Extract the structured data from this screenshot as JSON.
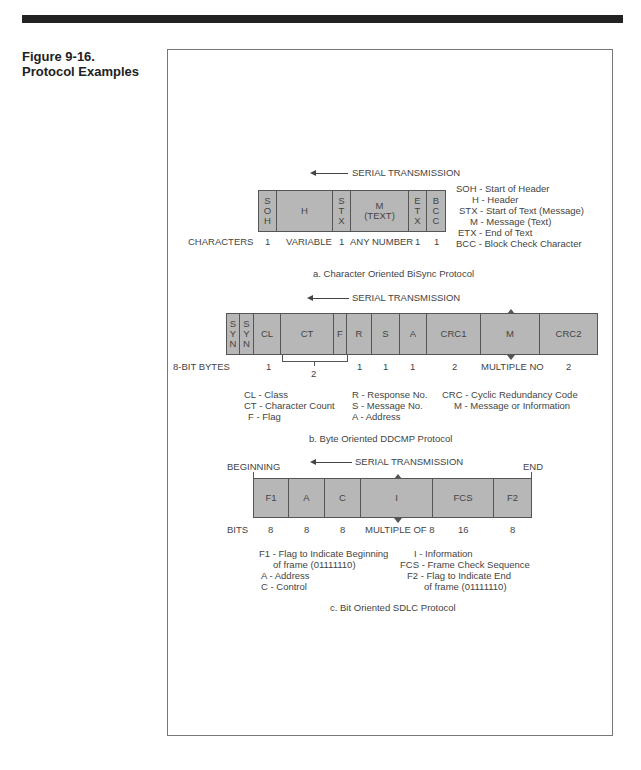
{
  "figure": {
    "number": "Figure 9-16.",
    "title": "Protocol Examples"
  },
  "serial_label": "SERIAL TRANSMISSION",
  "diagram_a": {
    "caption": "a. Character Oriented BiSync Protocol",
    "row_label": "CHARACTERS",
    "fields": [
      {
        "label": "S\nO\nH",
        "size": "1"
      },
      {
        "label": "H",
        "size": "VARIABLE"
      },
      {
        "label": "S\nT\nX",
        "size": "1"
      },
      {
        "label": "M\n(TEXT)",
        "size": "ANY NUMBER"
      },
      {
        "label": "E\nT\nX",
        "size": "1"
      },
      {
        "label": "B\nC\nC",
        "size": "1"
      }
    ],
    "legend": [
      "SOH - Start of Header",
      "H - Header",
      "STX - Start of Text (Message)",
      "M - Message (Text)",
      "ETX - End of Text",
      "BCC - Block Check Character"
    ]
  },
  "diagram_b": {
    "caption": "b. Byte Oriented DDCMP Protocol",
    "row_label": "8-BIT BYTES",
    "fields": [
      {
        "label": "S\nY\nN",
        "size": ""
      },
      {
        "label": "S\nY\nN",
        "size": ""
      },
      {
        "label": "CL",
        "size": "1"
      },
      {
        "label": "CT",
        "size": ""
      },
      {
        "label": "F",
        "size": ""
      },
      {
        "label": "R",
        "size": "1"
      },
      {
        "label": "S",
        "size": "1"
      },
      {
        "label": "A",
        "size": "1"
      },
      {
        "label": "CRC1",
        "size": "2"
      },
      {
        "label": "M",
        "size": "MULTIPLE NO"
      },
      {
        "label": "CRC2",
        "size": "2"
      }
    ],
    "ct_f_size": "2",
    "legend_col1": [
      "CL - Class",
      "CT - Character Count",
      "F - Flag"
    ],
    "legend_col2": [
      "R - Response No.",
      "S - Message No.",
      "A - Address"
    ],
    "legend_col3": [
      "CRC - Cyclic Redundancy Code",
      "M - Message or Information"
    ]
  },
  "diagram_c": {
    "caption": "c. Bit Oriented SDLC Protocol",
    "row_label": "BITS",
    "begin_label": "BEGINNING",
    "end_label": "END",
    "fields": [
      {
        "label": "F1",
        "size": "8"
      },
      {
        "label": "A",
        "size": "8"
      },
      {
        "label": "C",
        "size": "8"
      },
      {
        "label": "I",
        "size": "MULTIPLE OF 8"
      },
      {
        "label": "FCS",
        "size": "16"
      },
      {
        "label": "F2",
        "size": "8"
      }
    ],
    "legend_col1": [
      "F1 - Flag to Indicate Beginning",
      "of frame (01111110)",
      "A - Address",
      "C - Control"
    ],
    "legend_col2": [
      "I - Information",
      "FCS - Frame Check Sequence",
      "F2 - Flag to Indicate End",
      "of frame (01111110)"
    ]
  }
}
